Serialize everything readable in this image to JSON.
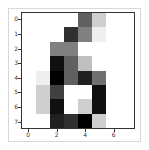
{
  "chart_data": {
    "type": "heatmap",
    "title": "",
    "xlabel": "",
    "ylabel": "",
    "colormap": "gray_r",
    "value_range": [
      0,
      16
    ],
    "x_ticks": [
      "0",
      "2",
      "4",
      "6"
    ],
    "y_ticks": [
      "0",
      "1",
      "2",
      "3",
      "4",
      "5",
      "6",
      "7"
    ],
    "grid": false,
    "values": [
      [
        0,
        0,
        0,
        0,
        10,
        3,
        0,
        0
      ],
      [
        0,
        0,
        0,
        13,
        8,
        1,
        0,
        0
      ],
      [
        0,
        0,
        8,
        8,
        0,
        0,
        0,
        0
      ],
      [
        0,
        0,
        15,
        10,
        4,
        0,
        0,
        0
      ],
      [
        0,
        1,
        16,
        10,
        14,
        9,
        0,
        0
      ],
      [
        0,
        3,
        12,
        0,
        0,
        15,
        0,
        0
      ],
      [
        0,
        3,
        15,
        0,
        3,
        15,
        0,
        0
      ],
      [
        0,
        0,
        14,
        13,
        16,
        3,
        0,
        0
      ]
    ]
  },
  "axes": {
    "x_tick_labels": [
      "0",
      "2",
      "4",
      "6"
    ],
    "y_tick_labels": [
      "0",
      "1",
      "2",
      "3",
      "4",
      "5",
      "6",
      "7"
    ]
  }
}
